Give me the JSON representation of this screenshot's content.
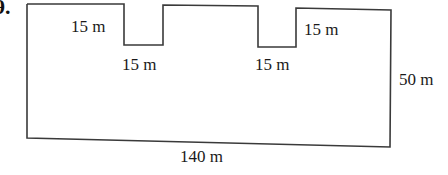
{
  "problem": {
    "number_fragment": "9.",
    "shape": "rectilinear polygon with two rectangular notches cut from the top edge"
  },
  "labels": {
    "top_left_step": "15 m",
    "notch1_width": "15 m",
    "notch2_width": "15 m",
    "top_right_step": "15 m",
    "height": "50 m",
    "width": "140 m"
  },
  "colors": {
    "line": "#3a3a3a",
    "text": "#1a1a1a",
    "background": "#ffffff"
  }
}
